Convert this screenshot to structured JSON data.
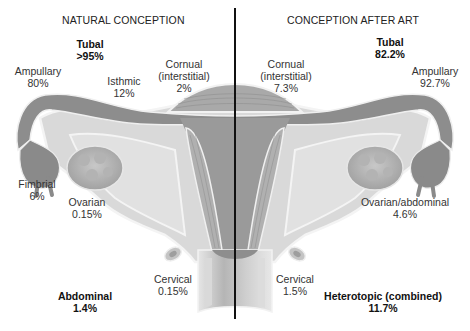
{
  "left_panel": {
    "title": "NATURAL CONCEPTION",
    "sites": {
      "tubal": {
        "name": "Tubal",
        "pct": ">95%"
      },
      "ampullary": {
        "name": "Ampullary",
        "pct": "80%"
      },
      "isthmic": {
        "name": "Isthmic",
        "pct": "12%"
      },
      "cornual": {
        "name": "Cornual",
        "name2": "(interstitial)",
        "pct": "2%"
      },
      "fimbrial": {
        "name": "Fimbrial",
        "pct": "6%"
      },
      "ovarian": {
        "name": "Ovarian",
        "pct": "0.15%"
      },
      "cervical": {
        "name": "Cervical",
        "pct": "0.15%"
      },
      "abdominal": {
        "name": "Abdominal",
        "pct": "1.4%"
      }
    }
  },
  "right_panel": {
    "title": "CONCEPTION AFTER ART",
    "sites": {
      "tubal": {
        "name": "Tubal",
        "pct": "82.2%"
      },
      "cornual": {
        "name": "Cornual",
        "name2": "(interstitial)",
        "pct": "7.3%"
      },
      "ampullary": {
        "name": "Ampullary",
        "pct": "92.7%"
      },
      "ovarian_abdominal": {
        "name": "Ovarian/abdominal",
        "pct": "4.6%"
      },
      "cervical": {
        "name": "Cervical",
        "pct": "1.5%"
      },
      "heterotopic": {
        "name": "Heterotopic (combined)",
        "pct": "11.7%"
      }
    }
  },
  "colors": {
    "tube_dark": "#8a8a8a",
    "tissue_light": "#d4d4d4",
    "tissue_mid": "#b8b8b8",
    "outline": "#f2f2f2",
    "divider": "#111111"
  }
}
